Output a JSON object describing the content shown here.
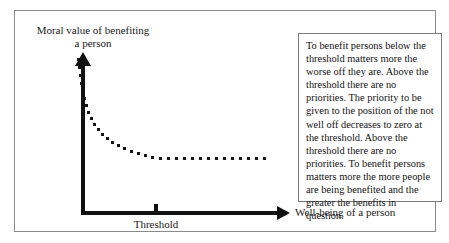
{
  "figure": {
    "axes": {
      "y_label": "Moral value of benefiting a person",
      "x_label": "Well-being of a person",
      "threshold_label": "Threshold"
    },
    "annotation": {
      "text": "To benefit persons below the threshold matters more the worse off they are. Above the threshold there are no priorities. The priority to be given to the position of the not well off decreases to zero at the threshold. Above the threshold there are no priorities. To benefit persons matters more the more people are being benefited and the greater the benefits in question."
    },
    "colors": {
      "frame": "#8a8a8a",
      "axis": "#111111",
      "dot": "#141414",
      "box_border": "#7d7d7d",
      "text": "#141414",
      "background": "#ffffff"
    }
  },
  "chart_data": {
    "type": "scatter",
    "title": "",
    "xlabel": "Well-being of a person",
    "ylabel": "Moral value of benefiting a person",
    "xlim": [
      0,
      100
    ],
    "ylim": [
      0,
      100
    ],
    "grid": false,
    "legend": null,
    "annotations": [
      {
        "name": "threshold-tick",
        "x": 35,
        "label": "Threshold"
      }
    ],
    "series": [
      {
        "name": "moral value of benefiting",
        "marker": "square-dot",
        "points": [
          {
            "x": 76,
            "y": 57
          },
          {
            "x": 77,
            "y": 65
          },
          {
            "x": 78,
            "y": 73
          },
          {
            "x": 79,
            "y": 81
          },
          {
            "x": 80,
            "y": 89
          },
          {
            "x": 82,
            "y": 96
          },
          {
            "x": 84,
            "y": 103
          },
          {
            "x": 86,
            "y": 110
          },
          {
            "x": 89,
            "y": 116
          },
          {
            "x": 92,
            "y": 122
          },
          {
            "x": 96,
            "y": 127
          },
          {
            "x": 100,
            "y": 132
          },
          {
            "x": 105,
            "y": 136
          },
          {
            "x": 110,
            "y": 140
          },
          {
            "x": 116,
            "y": 143
          },
          {
            "x": 122,
            "y": 146
          },
          {
            "x": 129,
            "y": 149
          },
          {
            "x": 136,
            "y": 151
          },
          {
            "x": 143,
            "y": 153
          },
          {
            "x": 150,
            "y": 155
          },
          {
            "x": 158,
            "y": 156
          },
          {
            "x": 166,
            "y": 156
          },
          {
            "x": 174,
            "y": 156
          },
          {
            "x": 182,
            "y": 156
          },
          {
            "x": 190,
            "y": 156
          },
          {
            "x": 198,
            "y": 156
          },
          {
            "x": 206,
            "y": 156
          },
          {
            "x": 214,
            "y": 156
          },
          {
            "x": 222,
            "y": 156
          },
          {
            "x": 230,
            "y": 156
          },
          {
            "x": 238,
            "y": 156
          },
          {
            "x": 246,
            "y": 156
          },
          {
            "x": 254,
            "y": 156
          },
          {
            "x": 262,
            "y": 156
          }
        ]
      }
    ]
  }
}
